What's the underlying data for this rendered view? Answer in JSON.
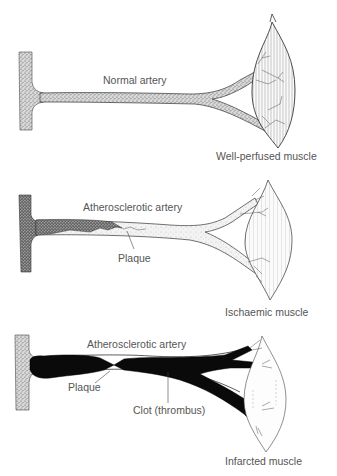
{
  "diagram": {
    "panels": [
      {
        "id": "normal",
        "artery_label": "Normal artery",
        "muscle_label": "Well-perfused muscle"
      },
      {
        "id": "atherosclerotic",
        "artery_label": "Atherosclerotic artery",
        "plaque_label": "Plaque",
        "muscle_label": "Ischaemic muscle"
      },
      {
        "id": "thrombosed",
        "artery_label": "Atherosclerotic artery",
        "plaque_label": "Plaque",
        "clot_label": "Clot (thrombus)",
        "muscle_label": "Infarcted muscle"
      }
    ],
    "colors": {
      "background": "#ffffff",
      "ink": "#222222",
      "label": "#555555",
      "stipple": "#888888",
      "clot": "#0a0a0a"
    }
  }
}
